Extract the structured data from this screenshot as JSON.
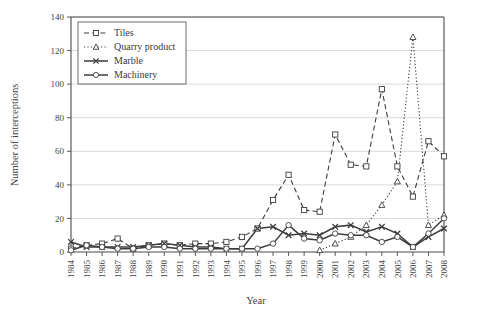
{
  "chart_data": {
    "type": "line",
    "title": "",
    "xlabel": "Year",
    "ylabel": "Number of interceptions",
    "grid": true,
    "legend_position": "top-left",
    "xlim": [
      1984,
      2008
    ],
    "ylim": [
      0,
      140
    ],
    "yticks": [
      0,
      20,
      40,
      60,
      80,
      100,
      120,
      140
    ],
    "categories": [
      "1984",
      "1985",
      "1986",
      "1987",
      "1988",
      "1989",
      "1990",
      "1991",
      "1992",
      "1993",
      "1994",
      "1995",
      "1996",
      "1997",
      "1998",
      "1999",
      "2000",
      "2001",
      "2002",
      "2003",
      "2004",
      "2005",
      "2006",
      "2007",
      "2008"
    ],
    "series": [
      {
        "name": "Tiles",
        "line_style": "dashed",
        "marker": "square",
        "values": [
          2,
          4,
          5,
          8,
          2,
          4,
          5,
          4,
          5,
          5,
          6,
          9,
          14,
          31,
          46,
          25,
          24,
          70,
          52,
          51,
          97,
          51,
          33,
          66,
          57
        ]
      },
      {
        "name": "Quarry product",
        "line_style": "dotted",
        "marker": "triangle",
        "values": [
          0,
          0,
          0,
          0,
          0,
          0,
          0,
          0,
          0,
          0,
          0,
          0,
          0,
          0,
          0,
          0,
          1,
          5,
          9,
          16,
          28,
          42,
          128,
          16,
          22
        ]
      },
      {
        "name": "Marble",
        "line_style": "solid",
        "marker": "x",
        "values": [
          6,
          3,
          3,
          3,
          3,
          4,
          5,
          4,
          3,
          3,
          2,
          2,
          14,
          15,
          10,
          11,
          10,
          15,
          16,
          12,
          15,
          11,
          3,
          9,
          14
        ]
      },
      {
        "name": "Machinery",
        "line_style": "solid",
        "marker": "circle",
        "values": [
          1,
          4,
          3,
          2,
          2,
          3,
          3,
          2,
          2,
          2,
          2,
          2,
          2,
          5,
          16,
          8,
          7,
          11,
          10,
          10,
          6,
          9,
          3,
          11,
          20
        ]
      }
    ]
  },
  "legend": {
    "entries": [
      "Tiles",
      "Quarry product",
      "Marble",
      "Machinery"
    ]
  },
  "axes": {
    "ylabel": "Number of interceptions",
    "xlabel": "Year"
  },
  "colors": {
    "line": "#3c3c3c",
    "grid": "#c9c9c9",
    "axis": "#4a4a4a",
    "background": "#ffffff"
  }
}
